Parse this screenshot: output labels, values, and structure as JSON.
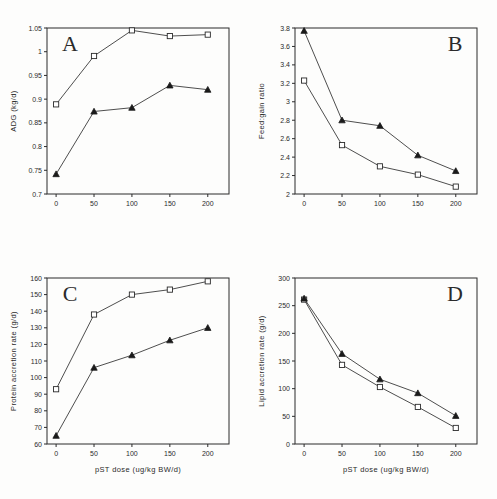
{
  "figure": {
    "title": "",
    "panel_count": 4,
    "series_names": [
      "Open square series",
      "Filled triangle series"
    ]
  },
  "chart_data": [
    {
      "panel": "A",
      "type": "line",
      "title": "A",
      "xlabel": "",
      "ylabel": "ADG (kg/d)",
      "x": [
        0,
        50,
        100,
        150,
        200
      ],
      "xticklabels": [
        "0",
        "50",
        "100",
        "150",
        "200"
      ],
      "xlim": [
        -12,
        228
      ],
      "ylim": [
        0.7,
        1.05
      ],
      "yticks": [
        0.7,
        0.75,
        0.8,
        0.85,
        0.9,
        0.95,
        1,
        1.05
      ],
      "yticklabels": [
        "0.7",
        "0.75",
        "0.8",
        "0.85",
        "0.9",
        "0.95",
        "1",
        "1.05"
      ],
      "grid": false,
      "legend": "none",
      "series": [
        {
          "name": "open-square",
          "marker": "open-square",
          "values": [
            0.889,
            0.991,
            1.045,
            1.033,
            1.036
          ]
        },
        {
          "name": "filled-triangle",
          "marker": "filled-triangle",
          "values": [
            0.742,
            0.874,
            0.882,
            0.929,
            0.92
          ]
        }
      ]
    },
    {
      "panel": "B",
      "type": "line",
      "title": "B",
      "xlabel": "",
      "ylabel": "Feed:gain ratio",
      "x": [
        0,
        50,
        100,
        150,
        200
      ],
      "xticklabels": [
        "0",
        "50",
        "100",
        "150",
        "200"
      ],
      "xlim": [
        -12,
        228
      ],
      "ylim": [
        2,
        3.8
      ],
      "yticks": [
        2,
        2.2,
        2.4,
        2.6,
        2.8,
        3,
        3.2,
        3.4,
        3.6,
        3.8
      ],
      "yticklabels": [
        "2",
        "2.2",
        "2.4",
        "2.6",
        "2.8",
        "3",
        "3.2",
        "3.4",
        "3.6",
        "3.8"
      ],
      "grid": false,
      "legend": "none",
      "series": [
        {
          "name": "open-square",
          "marker": "open-square",
          "values": [
            3.23,
            2.53,
            2.3,
            2.21,
            2.08
          ]
        },
        {
          "name": "filled-triangle",
          "marker": "filled-triangle",
          "values": [
            3.77,
            2.8,
            2.74,
            2.42,
            2.25
          ]
        }
      ]
    },
    {
      "panel": "C",
      "type": "line",
      "title": "C",
      "xlabel": "pST dose (ug/kg BW/d)",
      "ylabel": "Protein accretion rate (g/d)",
      "x": [
        0,
        50,
        100,
        150,
        200
      ],
      "xticklabels": [
        "0",
        "50",
        "100",
        "150",
        "200"
      ],
      "xlim": [
        -12,
        228
      ],
      "ylim": [
        60,
        160
      ],
      "yticks": [
        60,
        70,
        80,
        90,
        100,
        110,
        120,
        130,
        140,
        150,
        160
      ],
      "yticklabels": [
        "60",
        "70",
        "80",
        "90",
        "100",
        "110",
        "120",
        "130",
        "140",
        "150",
        "160"
      ],
      "grid": false,
      "legend": "none",
      "series": [
        {
          "name": "open-square",
          "marker": "open-square",
          "values": [
            93,
            138,
            150,
            153,
            158
          ]
        },
        {
          "name": "filled-triangle",
          "marker": "filled-triangle",
          "values": [
            65,
            106,
            113.5,
            122.5,
            130
          ]
        }
      ]
    },
    {
      "panel": "D",
      "type": "line",
      "title": "D",
      "xlabel": "pST dose (ug/kg BW/d)",
      "ylabel": "Lipid accretion rate (g/d)",
      "x": [
        0,
        50,
        100,
        150,
        200
      ],
      "xticklabels": [
        "0",
        "50",
        "100",
        "150",
        "200"
      ],
      "xlim": [
        -12,
        228
      ],
      "ylim": [
        0,
        300
      ],
      "yticks": [
        0,
        50,
        100,
        150,
        200,
        250,
        300
      ],
      "yticklabels": [
        "0",
        "50",
        "100",
        "150",
        "200",
        "250",
        "300"
      ],
      "grid": false,
      "legend": "none",
      "series": [
        {
          "name": "open-square",
          "marker": "open-square",
          "values": [
            261,
            143,
            103,
            67,
            29
          ]
        },
        {
          "name": "filled-triangle",
          "marker": "filled-triangle",
          "values": [
            263,
            163,
            117,
            92,
            51
          ]
        }
      ]
    }
  ]
}
